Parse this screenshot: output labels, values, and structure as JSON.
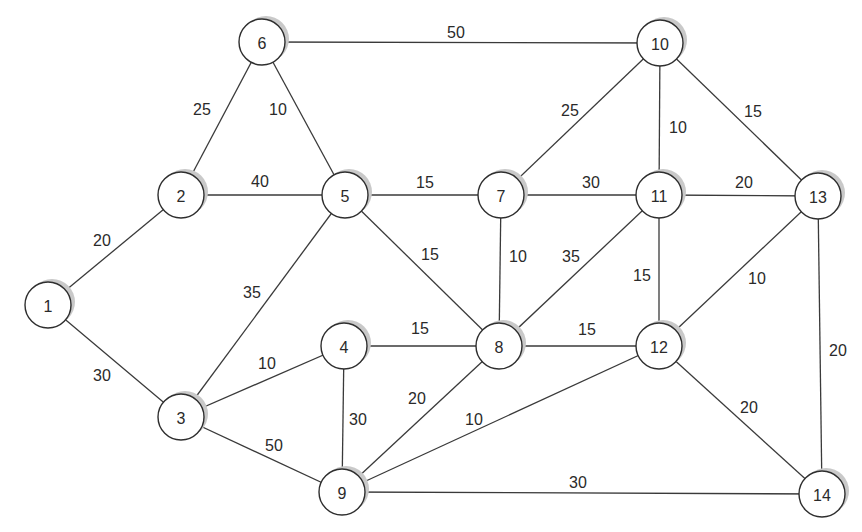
{
  "diagram": {
    "type": "weighted-undirected-graph",
    "nodes": [
      {
        "id": "1",
        "label": "1",
        "x": 48,
        "y": 305
      },
      {
        "id": "2",
        "label": "2",
        "x": 181,
        "y": 195
      },
      {
        "id": "3",
        "label": "3",
        "x": 181,
        "y": 417
      },
      {
        "id": "4",
        "label": "4",
        "x": 344,
        "y": 346
      },
      {
        "id": "5",
        "label": "5",
        "x": 345,
        "y": 195
      },
      {
        "id": "6",
        "label": "6",
        "x": 262,
        "y": 42
      },
      {
        "id": "7",
        "label": "7",
        "x": 501,
        "y": 195
      },
      {
        "id": "8",
        "label": "8",
        "x": 499,
        "y": 346
      },
      {
        "id": "9",
        "label": "9",
        "x": 342,
        "y": 492
      },
      {
        "id": "10",
        "label": "10",
        "x": 660,
        "y": 43
      },
      {
        "id": "11",
        "label": "11",
        "x": 659,
        "y": 195
      },
      {
        "id": "12",
        "label": "12",
        "x": 659,
        "y": 346
      },
      {
        "id": "13",
        "label": "13",
        "x": 818,
        "y": 196
      },
      {
        "id": "14",
        "label": "14",
        "x": 822,
        "y": 494
      }
    ],
    "edges": [
      {
        "from": "1",
        "to": "2",
        "weight": "20",
        "lx": 102,
        "ly": 240
      },
      {
        "from": "1",
        "to": "3",
        "weight": "30",
        "lx": 102,
        "ly": 375
      },
      {
        "from": "2",
        "to": "6",
        "weight": "25",
        "lx": 202,
        "ly": 109
      },
      {
        "from": "2",
        "to": "5",
        "weight": "40",
        "lx": 260,
        "ly": 181
      },
      {
        "from": "6",
        "to": "5",
        "weight": "10",
        "lx": 278,
        "ly": 109
      },
      {
        "from": "6",
        "to": "10",
        "weight": "50",
        "lx": 456,
        "ly": 32
      },
      {
        "from": "5",
        "to": "7",
        "weight": "15",
        "lx": 425,
        "ly": 182
      },
      {
        "from": "5",
        "to": "3",
        "weight": "35",
        "lx": 252,
        "ly": 292
      },
      {
        "from": "5",
        "to": "8",
        "weight": "15",
        "lx": 430,
        "ly": 254
      },
      {
        "from": "3",
        "to": "4",
        "weight": "10",
        "lx": 267,
        "ly": 363
      },
      {
        "from": "3",
        "to": "9",
        "weight": "50",
        "lx": 274,
        "ly": 445
      },
      {
        "from": "4",
        "to": "8",
        "weight": "15",
        "lx": 420,
        "ly": 328
      },
      {
        "from": "4",
        "to": "9",
        "weight": "30",
        "lx": 358,
        "ly": 419
      },
      {
        "from": "7",
        "to": "10",
        "weight": "25",
        "lx": 570,
        "ly": 110
      },
      {
        "from": "7",
        "to": "11",
        "weight": "30",
        "lx": 591,
        "ly": 182
      },
      {
        "from": "7",
        "to": "8",
        "weight": "10",
        "lx": 518,
        "ly": 256
      },
      {
        "from": "11",
        "to": "10",
        "weight": "10",
        "lx": 678,
        "ly": 127
      },
      {
        "from": "11",
        "to": "8",
        "weight": "35",
        "lx": 571,
        "ly": 256
      },
      {
        "from": "11",
        "to": "13",
        "weight": "20",
        "lx": 744,
        "ly": 182
      },
      {
        "from": "11",
        "to": "12",
        "weight": "15",
        "lx": 642,
        "ly": 275
      },
      {
        "from": "10",
        "to": "13",
        "weight": "15",
        "lx": 753,
        "ly": 111
      },
      {
        "from": "13",
        "to": "12",
        "weight": "10",
        "lx": 757,
        "ly": 278
      },
      {
        "from": "13",
        "to": "14",
        "weight": "20",
        "lx": 838,
        "ly": 350
      },
      {
        "from": "8",
        "to": "12",
        "weight": "15",
        "lx": 587,
        "ly": 329
      },
      {
        "from": "8",
        "to": "9",
        "weight": "20",
        "lx": 417,
        "ly": 398
      },
      {
        "from": "12",
        "to": "9",
        "weight": "10",
        "lx": 474,
        "ly": 419
      },
      {
        "from": "12",
        "to": "14",
        "weight": "20",
        "lx": 749,
        "ly": 407
      },
      {
        "from": "9",
        "to": "14",
        "weight": "30",
        "lx": 578,
        "ly": 482
      }
    ],
    "style": {
      "node_radius": 23,
      "line_color": "#3a3a3a",
      "node_fill": "#ffffff",
      "shadow_color": "#c9c9c9",
      "background": "#ffffff"
    }
  }
}
